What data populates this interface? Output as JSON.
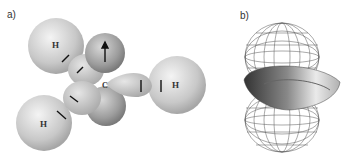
{
  "panels": [
    {
      "label": "a)",
      "description": "Orbital lobe model of methyl radical CH3 with three C-H bonds and a p orbital",
      "atoms": {
        "center": "C",
        "hydrogens": [
          "H",
          "H",
          "H"
        ]
      }
    },
    {
      "label": "b)",
      "description": "Wireframe p orbital lobes with solid torus-shaped surface"
    }
  ],
  "colors": {
    "sphere_light": "#e8e8e8",
    "sphere_mid": "#b8b8b8",
    "sphere_dark": "#8e8e8e",
    "wire": "#555555",
    "arrow": "#111111"
  }
}
